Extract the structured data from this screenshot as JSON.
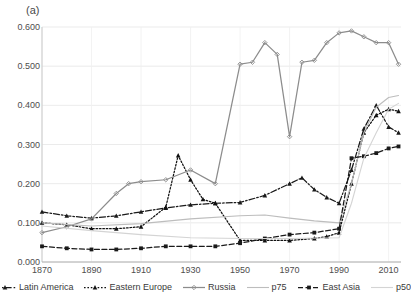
{
  "panel": {
    "label": "(a)"
  },
  "chart_data": {
    "type": "line",
    "title": "(a)",
    "xlabel": "",
    "ylabel": "",
    "xlim": [
      1870,
      2015
    ],
    "ylim": [
      0.0,
      0.6
    ],
    "grid": true,
    "legend_position": "bottom",
    "xticks": [
      1870,
      1890,
      1910,
      1930,
      1950,
      1970,
      1990,
      2010
    ],
    "ytick_labels": [
      "0.000",
      "0.100",
      "0.200",
      "0.300",
      "0.400",
      "0.500",
      "0.600"
    ],
    "yticks": [
      0.0,
      0.1,
      0.2,
      0.3,
      0.4,
      0.5,
      0.6
    ],
    "series": [
      {
        "name": "Latin America",
        "color": "#1a1a1a",
        "dash": "dashdot",
        "marker": "triangle",
        "x": [
          1870,
          1880,
          1890,
          1900,
          1910,
          1920,
          1930,
          1940,
          1950,
          1960,
          1970,
          1975,
          1980,
          1985,
          1990,
          1995,
          2000,
          2005,
          2010,
          2014
        ],
        "values": [
          0.128,
          0.118,
          0.112,
          0.118,
          0.128,
          0.138,
          0.146,
          0.15,
          0.152,
          0.17,
          0.2,
          0.215,
          0.185,
          0.165,
          0.15,
          0.235,
          0.34,
          0.4,
          0.345,
          0.33
        ]
      },
      {
        "name": "Eastern Europe",
        "color": "#111111",
        "dash": "dotted-heavy",
        "marker": "triangle",
        "x": [
          1870,
          1880,
          1890,
          1900,
          1910,
          1920,
          1925,
          1930,
          1935,
          1940,
          1950,
          1960,
          1970,
          1980,
          1985,
          1990,
          1995,
          2000,
          2005,
          2010,
          2014
        ],
        "values": [
          0.1,
          0.095,
          0.085,
          0.085,
          0.09,
          0.14,
          0.272,
          0.21,
          0.16,
          0.15,
          0.055,
          0.055,
          0.055,
          0.06,
          0.065,
          0.075,
          0.2,
          0.33,
          0.375,
          0.39,
          0.385
        ]
      },
      {
        "name": "Russia",
        "color": "#8c8c8c",
        "dash": "solid",
        "marker": "diamond",
        "x": [
          1870,
          1880,
          1890,
          1900,
          1905,
          1910,
          1920,
          1930,
          1940,
          1950,
          1955,
          1960,
          1965,
          1970,
          1975,
          1980,
          1985,
          1990,
          1995,
          2000,
          2005,
          2010,
          2014
        ],
        "values": [
          0.075,
          0.09,
          0.11,
          0.175,
          0.2,
          0.205,
          0.21,
          0.235,
          0.2,
          0.505,
          0.51,
          0.56,
          0.53,
          0.32,
          0.51,
          0.515,
          0.56,
          0.585,
          0.59,
          0.575,
          0.56,
          0.56,
          0.505
        ]
      },
      {
        "name": "p75",
        "color": "#bdbdbd",
        "dash": "solid",
        "marker": "none",
        "x": [
          1870,
          1890,
          1910,
          1930,
          1950,
          1960,
          1970,
          1980,
          1990,
          1995,
          2000,
          2005,
          2010,
          2014
        ],
        "values": [
          0.1,
          0.092,
          0.098,
          0.11,
          0.118,
          0.12,
          0.112,
          0.105,
          0.1,
          0.2,
          0.33,
          0.395,
          0.42,
          0.425
        ]
      },
      {
        "name": "East Asia",
        "color": "#1a1a1a",
        "dash": "dashed",
        "marker": "square",
        "x": [
          1870,
          1880,
          1890,
          1900,
          1910,
          1920,
          1930,
          1940,
          1950,
          1960,
          1970,
          1980,
          1990,
          1995,
          2000,
          2005,
          2010,
          2014
        ],
        "values": [
          0.04,
          0.035,
          0.032,
          0.032,
          0.035,
          0.04,
          0.04,
          0.04,
          0.048,
          0.06,
          0.07,
          0.075,
          0.085,
          0.265,
          0.27,
          0.278,
          0.29,
          0.295
        ]
      },
      {
        "name": "p50",
        "color": "#d4d4d4",
        "dash": "solid",
        "marker": "none",
        "x": [
          1870,
          1890,
          1910,
          1930,
          1950,
          1970,
          1990,
          1995,
          2000,
          2005,
          2010,
          2014
        ],
        "values": [
          0.092,
          0.08,
          0.07,
          0.062,
          0.06,
          0.06,
          0.062,
          0.15,
          0.265,
          0.33,
          0.39,
          0.405
        ]
      }
    ]
  },
  "legend": {
    "items": [
      {
        "label": "Latin America",
        "key": "dashdot-triangle"
      },
      {
        "label": "Eastern Europe",
        "key": "dotted-triangle"
      },
      {
        "label": "Russia",
        "key": "dotted-diamond"
      },
      {
        "label": "p75",
        "key": "solid-gray"
      },
      {
        "label": "East Asia",
        "key": "dashed-square"
      },
      {
        "label": "p50",
        "key": "solid-lightgray"
      }
    ]
  }
}
